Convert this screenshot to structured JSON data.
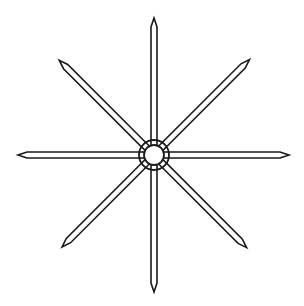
{
  "diagram": {
    "title": "",
    "background": "#ffffff",
    "stroke_color": "#1a1a1a",
    "center": [
      154,
      155
    ],
    "outer_ring_radius": 15,
    "inner_ring_radius": 10,
    "spoke_half_width": 3,
    "tip_length": 9,
    "spokes": [
      {
        "name": "north",
        "angle": -90,
        "length": 137
      },
      {
        "name": "north-east",
        "angle": -45,
        "length": 135
      },
      {
        "name": "east",
        "angle": 0,
        "length": 135
      },
      {
        "name": "south-east",
        "angle": 45,
        "length": 131
      },
      {
        "name": "south",
        "angle": 90,
        "length": 137
      },
      {
        "name": "south-west",
        "angle": 135,
        "length": 130
      },
      {
        "name": "west",
        "angle": 180,
        "length": 136
      },
      {
        "name": "north-west",
        "angle": -135,
        "length": 134
      }
    ]
  }
}
